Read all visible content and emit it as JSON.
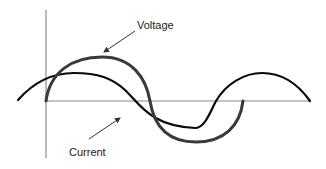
{
  "diagram": {
    "type": "phase-relationship",
    "labels": {
      "voltage": "Voltage",
      "current": "Current"
    },
    "colors": {
      "axis": "#8a8a8a",
      "voltage": "#3a3a3a",
      "current": "#0a0a0a",
      "text": "#1a1a1a"
    },
    "axes": {
      "vertical": {
        "x": 46,
        "y1": 10,
        "y2": 158
      },
      "horizontal": {
        "y": 101,
        "x1": 46,
        "x2": 310
      }
    },
    "curves": [
      {
        "name": "voltage",
        "description": "Larger-amplitude waveform starting at origin, one full cycle",
        "start": [
          46,
          101
        ],
        "peak": [
          102,
          57
        ],
        "zero_crossing": [
          150,
          101
        ],
        "trough": [
          196,
          142
        ],
        "end": [
          243,
          101
        ]
      },
      {
        "name": "current",
        "description": "Smaller-amplitude waveform, phase-shifted relative to voltage",
        "start": [
          18,
          100
        ],
        "peak": [
          74,
          73
        ],
        "zero_crossing_1": [
          165,
          101
        ],
        "trough": [
          200,
          128
        ],
        "zero_crossing_2": [
          214,
          101
        ],
        "peak_2": [
          262,
          73
        ],
        "end": [
          310,
          101
        ]
      }
    ],
    "annotations": [
      {
        "label": "Voltage",
        "text_pos": [
          137,
          29
        ],
        "arrow_from": [
          135,
          31
        ],
        "arrow_to": [
          103,
          53
        ]
      },
      {
        "label": "Current",
        "text_pos": [
          69,
          156
        ],
        "arrow_from": [
          89,
          139
        ],
        "arrow_to": [
          121,
          117
        ]
      }
    ]
  }
}
